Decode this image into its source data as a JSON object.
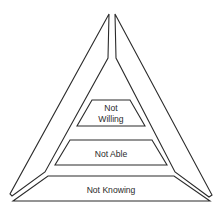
{
  "diagram": {
    "type": "pyramid",
    "levels": [
      {
        "id": "top",
        "label_line1": "Not",
        "label_line2": "Willing"
      },
      {
        "id": "middle",
        "label": "Not Able"
      },
      {
        "id": "bottom",
        "label": "Not Knowing"
      }
    ],
    "colors": {
      "stroke": "#2b2b2b",
      "fill": "#ffffff",
      "text": "#2a2a2a"
    }
  }
}
